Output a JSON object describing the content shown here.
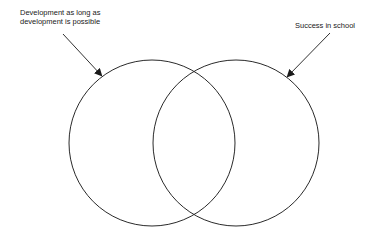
{
  "diagram": {
    "type": "venn",
    "sets": [
      {
        "label_line1": "Development as long as",
        "label_line2": "development is possible",
        "cx": 152,
        "cy": 143,
        "r": 83
      },
      {
        "label": "Success in school",
        "cx": 236,
        "cy": 143,
        "r": 83
      }
    ],
    "arrows": [
      {
        "x1": 63,
        "y1": 34,
        "x2": 101,
        "y2": 75
      },
      {
        "x1": 330,
        "y1": 33,
        "x2": 288,
        "y2": 76
      }
    ],
    "stroke_color": "#2a2a2a"
  }
}
